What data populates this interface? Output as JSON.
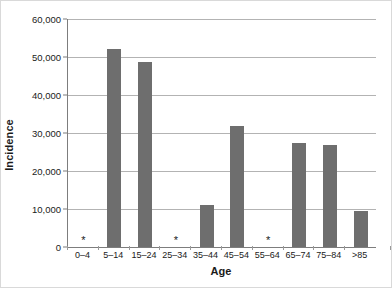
{
  "chart_data": {
    "type": "bar",
    "title": "",
    "xlabel": "Age",
    "ylabel": "Incidence",
    "categories": [
      "0–4",
      "5–14",
      "15–24",
      "25–34",
      "35–44",
      "45–54",
      "55–64",
      "65–74",
      "75–84",
      ">85"
    ],
    "values": [
      null,
      52000,
      48700,
      null,
      11100,
      31900,
      null,
      27300,
      26900,
      9400
    ],
    "suppressed_marker": "*",
    "suppressed_categories": [
      "0–4",
      "25–34",
      "55–64"
    ],
    "ylim": [
      0,
      60000
    ],
    "ytick_values": [
      0,
      10000,
      20000,
      30000,
      40000,
      50000,
      60000
    ],
    "ytick_labels": [
      "0",
      "10,000",
      "20,000",
      "30,000",
      "40,000",
      "50,000",
      "60,000"
    ],
    "grid": true,
    "legend": false,
    "bar_color": "#6e6e6e",
    "gridline_color": "#b3b3b3",
    "axis_color": "#7d7d7d",
    "background_color": "#ffffff"
  }
}
